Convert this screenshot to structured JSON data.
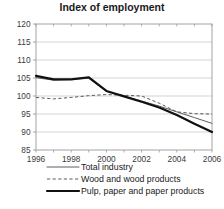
{
  "chart_data": {
    "type": "line",
    "title": "Index of employment",
    "xlabel": "",
    "ylabel": "",
    "xlim": [
      1996,
      2006
    ],
    "ylim": [
      85,
      120
    ],
    "grid": true,
    "grid_axis": "y",
    "legend_position": "below",
    "x_ticks": [
      "1996",
      "1998",
      "2000",
      "2002",
      "2004",
      "2006"
    ],
    "y_ticks": [
      "85",
      "90",
      "95",
      "100",
      "105",
      "110",
      "115",
      "120"
    ],
    "x": [
      1996,
      1997,
      1998,
      1999,
      2000,
      2001,
      2002,
      2003,
      2004,
      2005,
      2006
    ],
    "series": [
      {
        "name": "Total industry",
        "style": "solid-thin",
        "color": "#5f5f5f",
        "values": [
          105.1,
          104.4,
          104.6,
          104.9,
          101.3,
          100.0,
          98.6,
          97.2,
          95.6,
          94.0,
          92.4
        ]
      },
      {
        "name": "Wood and wood products",
        "style": "dashed",
        "color": "#5a5a5a",
        "values": [
          99.6,
          99.2,
          99.6,
          100.1,
          100.4,
          100.2,
          100.0,
          98.0,
          95.6,
          95.1,
          95.0
        ]
      },
      {
        "name": "Pulp, paper and paper products",
        "style": "solid-thick",
        "color": "#111111",
        "values": [
          105.6,
          104.6,
          104.6,
          105.2,
          101.4,
          99.9,
          98.4,
          96.8,
          94.7,
          92.3,
          90.0
        ]
      }
    ]
  },
  "legend": {
    "items": [
      {
        "label": "Total industry"
      },
      {
        "label": "Wood and wood products"
      },
      {
        "label": "Pulp, paper and paper products"
      }
    ]
  },
  "colors": {
    "axis": "#9a9a9a",
    "grid": "#c9c9c9",
    "text": "#1a1a1a",
    "plot_background": "#ffffff"
  }
}
